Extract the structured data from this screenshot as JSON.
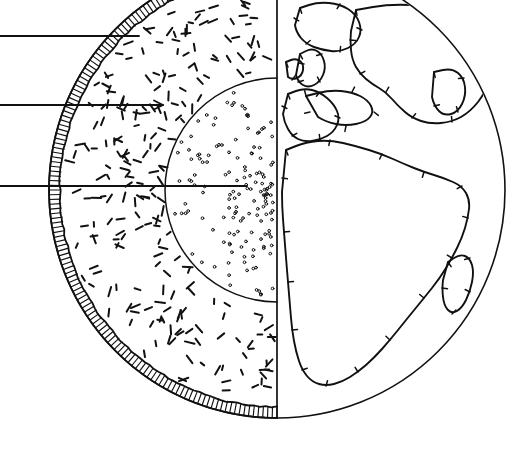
{
  "figure": {
    "kind": "line-drawing-diagram",
    "background_color": "#ffffff",
    "ink_color": "#111111",
    "width": 531,
    "height": 468
  },
  "globe": {
    "name": "earth-globe",
    "center_x": 277,
    "center_y": 190,
    "radius": 228,
    "terminator_x": 277,
    "description": "Sphere bisected by a vertical line; left half cut away, right half shows surface"
  },
  "crust_band": {
    "name": "atmosphere-crust-band",
    "thickness": 11,
    "hatch_count": 150,
    "description": "Hatched annulus along the left limb representing crust / atmosphere shell"
  },
  "mantle": {
    "name": "mantle-layer",
    "texture": "short-dashes",
    "dash_count": 230,
    "inner_radius": 112,
    "description": "Dash-stippled region between crust and core"
  },
  "core": {
    "name": "core-layer",
    "texture": "dots",
    "radius": 112,
    "dot_count": 150,
    "description": "Fine dotted interior circle"
  },
  "rays": [
    {
      "name": "solar-ray-top",
      "y": 36,
      "x_start": 0,
      "x_end": 139,
      "arrowhead": false
    },
    {
      "name": "solar-ray-middle",
      "y": 105,
      "x_start": 0,
      "x_end": 163,
      "arrowhead": true
    },
    {
      "name": "solar-ray-bottom",
      "y": 186,
      "x_start": 0,
      "x_end": 247,
      "arrowhead": false
    }
  ],
  "landmasses": [
    {
      "name": "greenland",
      "label": "Greenland"
    },
    {
      "name": "scandinavia",
      "label": "Scandinavia"
    },
    {
      "name": "eurasia",
      "label": "Eurasia"
    },
    {
      "name": "iberia-europe",
      "label": "Western Europe"
    },
    {
      "name": "mediterranean",
      "label": "Mediterranean"
    },
    {
      "name": "arabia",
      "label": "Arabian Peninsula"
    },
    {
      "name": "africa",
      "label": "Africa"
    },
    {
      "name": "madagascar",
      "label": "Madagascar"
    },
    {
      "name": "iceland",
      "label": "Iceland"
    }
  ],
  "coast_hatch": {
    "name": "coastline-shading-ticks",
    "description": "Short perpendicular ticks on the inland side of coastlines"
  }
}
